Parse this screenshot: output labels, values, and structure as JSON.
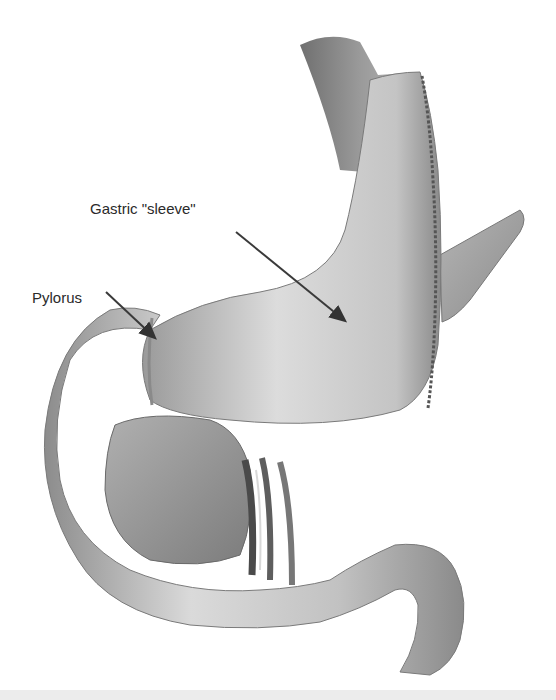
{
  "figure": {
    "style": "grayscale",
    "labels": {
      "sleeve": "Gastric \"sleeve\"",
      "pylorus": "Pylorus"
    },
    "colors": {
      "background": "#ffffff",
      "label_text": "#2a2a2a",
      "arrow": "#3a3a3a",
      "tissue_light": "#e6e6e6",
      "tissue_mid": "#a8a8a8",
      "tissue_dark": "#555555",
      "bottom_band": "#ececec"
    }
  }
}
